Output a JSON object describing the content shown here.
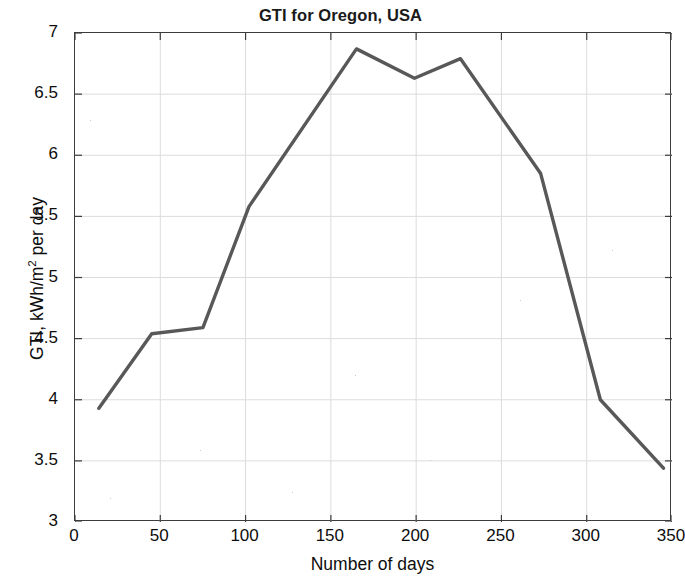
{
  "chart_data": {
    "type": "line",
    "title": "GTI for Oregon, USA",
    "xlabel": "Number of days",
    "ylabel": "GTI, kWh/m2 per day",
    "ylabel_base": "GTI, kWh/m",
    "ylabel_sup": "2",
    "ylabel_tail": " per day",
    "xlim": [
      0,
      350
    ],
    "ylim": [
      3,
      7
    ],
    "grid": true,
    "legend": null,
    "xticks": [
      0,
      50,
      100,
      150,
      200,
      250,
      300,
      350
    ],
    "xtick_labels": [
      "0",
      "50",
      "100",
      "150",
      "200",
      "250",
      "300",
      "350"
    ],
    "yticks": [
      3,
      3.5,
      4,
      4.5,
      5,
      5.5,
      6,
      6.5,
      7
    ],
    "ytick_labels": [
      "3",
      "3.5",
      "4",
      "4.5",
      "5",
      "5.5",
      "6",
      "6.5",
      "7"
    ],
    "line_color": "#585858",
    "line_width": 3.4,
    "x": [
      14,
      45,
      75,
      102,
      165,
      199,
      226,
      273,
      308,
      345
    ],
    "values": [
      3.93,
      4.54,
      4.59,
      5.58,
      6.87,
      6.63,
      6.79,
      5.85,
      4.0,
      3.44
    ],
    "series": [
      {
        "name": "GTI",
        "x": [
          14,
          45,
          75,
          102,
          165,
          199,
          226,
          273,
          308,
          345
        ],
        "values": [
          3.93,
          4.54,
          4.59,
          5.58,
          6.87,
          6.63,
          6.79,
          5.85,
          4.0,
          3.44
        ]
      }
    ]
  }
}
